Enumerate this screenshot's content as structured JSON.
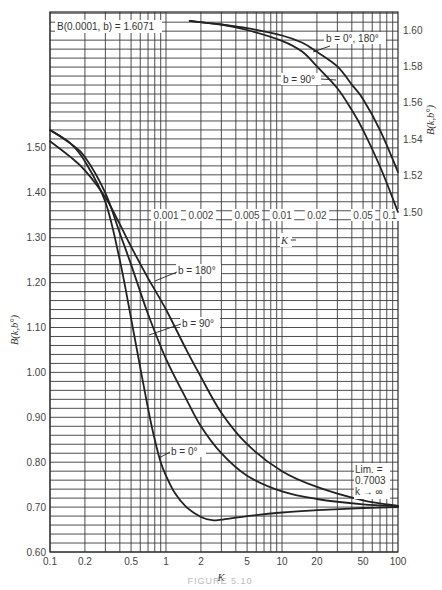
{
  "chart_data": {
    "type": "line",
    "title": "",
    "xlabel": "K",
    "ylabel": "B(k, b°)",
    "xscale": "log",
    "xlim": [
      0.1,
      100
    ],
    "ylim": [
      0.6,
      1.6
    ],
    "x_ticks": [
      "0.1",
      "0.2",
      "0.5",
      "1",
      "2",
      "5",
      "10",
      "20",
      "50",
      "100"
    ],
    "y_ticks": [
      "0.60",
      "0.70",
      "0.80",
      "0.90",
      "1.00",
      "1.10",
      "1.20",
      "1.30",
      "1.40",
      "1.50"
    ],
    "grid": true,
    "series": [
      {
        "name": "b = 0°",
        "x": [
          0.1,
          0.15,
          0.2,
          0.3,
          0.4,
          0.5,
          0.6,
          0.7,
          0.8,
          0.9,
          1,
          1.2,
          1.5,
          2,
          2.5,
          3,
          5,
          10,
          20,
          50,
          100
        ],
        "y": [
          1.54,
          1.51,
          1.47,
          1.38,
          1.25,
          1.12,
          1.01,
          0.92,
          0.85,
          0.8,
          0.77,
          0.73,
          0.7,
          0.678,
          0.671,
          0.672,
          0.68,
          0.688,
          0.693,
          0.698,
          0.7
        ]
      },
      {
        "name": "b = 90°",
        "x": [
          0.1,
          0.15,
          0.2,
          0.3,
          0.4,
          0.5,
          0.7,
          1,
          1.5,
          2,
          3,
          5,
          10,
          20,
          50,
          100
        ],
        "y": [
          1.54,
          1.51,
          1.48,
          1.4,
          1.31,
          1.24,
          1.13,
          1.03,
          0.94,
          0.88,
          0.82,
          0.77,
          0.735,
          0.718,
          0.706,
          0.702
        ]
      },
      {
        "name": "b = 180°",
        "x": [
          0.1,
          0.15,
          0.2,
          0.3,
          0.4,
          0.5,
          0.7,
          1,
          1.5,
          2,
          3,
          5,
          10,
          20,
          50,
          100
        ],
        "y": [
          1.515,
          1.48,
          1.45,
          1.39,
          1.33,
          1.28,
          1.21,
          1.14,
          1.05,
          0.99,
          0.91,
          0.84,
          0.78,
          0.745,
          0.715,
          0.703
        ]
      }
    ],
    "inset": {
      "xlabel": "K",
      "ylabel": "B(k, b°)",
      "xscale": "log",
      "xlim": [
        0.001,
        0.1
      ],
      "ylim": [
        1.5,
        1.6
      ],
      "x_ticks": [
        "0.001",
        "0.002",
        "0.005",
        "0.01",
        "0.02",
        "0.05",
        "0.1"
      ],
      "y_ticks": [
        "1.50",
        "1.52",
        "1.54",
        "1.56",
        "1.58",
        "1.60"
      ],
      "series": [
        {
          "name": "b = 0°, 180°",
          "x": [
            0.0016,
            0.003,
            0.005,
            0.01,
            0.015,
            0.02,
            0.03,
            0.04,
            0.05,
            0.07,
            0.1
          ],
          "y": [
            1.605,
            1.603,
            1.601,
            1.597,
            1.593,
            1.588,
            1.58,
            1.57,
            1.562,
            1.545,
            1.522
          ]
        },
        {
          "name": "b = 90°",
          "x": [
            0.0016,
            0.003,
            0.005,
            0.01,
            0.015,
            0.02,
            0.03,
            0.04,
            0.05,
            0.07,
            0.1
          ],
          "y": [
            1.605,
            1.603,
            1.6,
            1.594,
            1.588,
            1.58,
            1.568,
            1.556,
            1.545,
            1.525,
            1.5
          ]
        }
      ]
    },
    "annotations": [
      "B(0.0001, b) = 1.6071",
      "Lim. = 0.7003 k → ∞"
    ],
    "legend": "inline labels"
  },
  "labels": {
    "inset_note": "B(0.0001, b) = 1.6071",
    "main_b0": "b = 0°",
    "main_b90": "b = 90°",
    "main_b180": "b = 180°",
    "inset_b0_180": "b = 0°, 180°",
    "inset_b90": "b = 90°",
    "lim_1": "Lim. =",
    "lim_2": "0.7003",
    "lim_3": "k → ∞",
    "xlabel": "K",
    "inset_xlabel": "K",
    "ylabel": "B(k,b°)",
    "inset_ylabel": "B(k,b°)",
    "caption": "FIGURE 5.10"
  },
  "colors": {
    "curve": "#222222",
    "grid": "#3a3a3a",
    "text": "#444444",
    "background": "#ffffff"
  }
}
